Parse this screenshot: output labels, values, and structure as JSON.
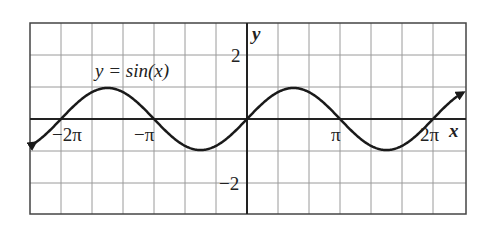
{
  "chart_data": {
    "type": "line",
    "title": "",
    "function": "y = sin(x)",
    "series_label": "y = sin(x)",
    "xlabel": "x",
    "ylabel": "y",
    "x_tick_labels": [
      "−2π",
      "−π",
      "π",
      "2π"
    ],
    "y_tick_labels": [
      "2",
      "−2"
    ],
    "xlim_units": "approximately −2.5π to 2.5π (read from grid extent)",
    "ylim": [
      -3,
      3
    ],
    "grid": true,
    "arrows_at_ends": true,
    "values_provenance": "computed from y = sin(x) at chosen sample points; NOT digitized from the image",
    "x_samples": [
      "−2π",
      "−3π/2",
      "−π",
      "−π/2",
      "0",
      "π/2",
      "π",
      "3π/2",
      "2π"
    ],
    "y_samples": [
      0,
      1,
      0,
      -1,
      0,
      1,
      0,
      -1,
      0
    ]
  },
  "labels": {
    "function": "y = sin(x)",
    "x_axis": "x",
    "y_axis": "y",
    "tick_2": "2",
    "tick_neg2": "−2",
    "tick_neg2pi": "−2π",
    "tick_negpi": "−π",
    "tick_pi": "π",
    "tick_2pi": "2π"
  },
  "colors": {
    "grid": "#9a9a9a",
    "axis": "#222222",
    "curve": "#1a1a1a",
    "background": "#ffffff"
  }
}
